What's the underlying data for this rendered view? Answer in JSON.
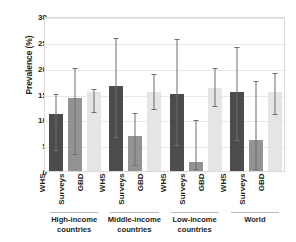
{
  "chart_data": {
    "type": "bar",
    "title": "",
    "xlabel": "",
    "ylabel": "Prevalence (%)",
    "ylim": [
      0,
      30
    ],
    "yticks": [
      0,
      5,
      10,
      15,
      20,
      25,
      30
    ],
    "grid": true,
    "legend": "none",
    "orientation": "vertical",
    "grouped": true,
    "error_bars": true,
    "categories": [
      "High-income countries",
      "Middle-income countries",
      "Low-income countries",
      "World"
    ],
    "series_names": [
      "WHS",
      "Surveys",
      "GBD"
    ],
    "series_colors": [
      "#4d4b4c",
      "#949393",
      "#e6e5e5"
    ],
    "series": [
      {
        "name": "WHS",
        "color": "#4d4b4c",
        "values": [
          11.0,
          16.5,
          15.0,
          15.3
        ],
        "ci_low": [
          4.0,
          6.5,
          5.0,
          6.0
        ],
        "ci_high": [
          15.0,
          25.7,
          25.5,
          24.0
        ]
      },
      {
        "name": "Surveys",
        "color": "#949393",
        "values": [
          14.1,
          6.8,
          1.8,
          6.0
        ],
        "ci_low": [
          3.2,
          1.2,
          0.3,
          0.3
        ],
        "ci_high": [
          20.0,
          11.3,
          9.8,
          17.5
        ]
      },
      {
        "name": "GBD",
        "color": "#e6e5e5",
        "values": [
          15.3,
          15.3,
          16.0,
          15.2
        ],
        "ci_low": [
          11.5,
          12.0,
          12.5,
          11.0
        ],
        "ci_high": [
          15.8,
          18.7,
          20.0,
          19.0
        ]
      }
    ],
    "x_tick_labels": [
      [
        "WHS",
        "Surveys",
        "GBD"
      ],
      [
        "WHS",
        "Surveys",
        "GBD"
      ],
      [
        "WHS",
        "Surveys",
        "GBD"
      ],
      [
        "WHS",
        "Surveys",
        "GBD"
      ]
    ],
    "group_labels": [
      {
        "line1": "High-income",
        "line2": "countries"
      },
      {
        "line1": "Middle-income",
        "line2": "countries"
      },
      {
        "line1": "Low-income",
        "line2": "countries"
      },
      {
        "line1": "World",
        "line2": ""
      }
    ]
  },
  "axis": {
    "y_title": "Prevalence (%)",
    "y_ticks": [
      "30",
      "25",
      "20",
      "15",
      "10",
      "5",
      "0"
    ]
  }
}
